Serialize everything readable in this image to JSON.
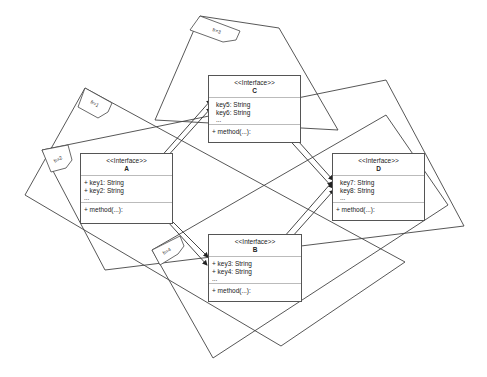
{
  "frames": [
    {
      "id": "fr1",
      "label": "fr=1"
    },
    {
      "id": "fr2",
      "label": "fr=2"
    },
    {
      "id": "fr3",
      "label": "fr=3"
    },
    {
      "id": "fr4",
      "label": "fr=4"
    }
  ],
  "classes": {
    "A": {
      "stereotype": "<<Interface>>",
      "name": "A",
      "attrs": [
        "+ key1: String",
        "+ key2: String"
      ],
      "ellipsis": "...",
      "method": "+ method(...):"
    },
    "B": {
      "stereotype": "<<Interface>>",
      "name": "B",
      "attrs": [
        "+ key3: String",
        "+ key4: String"
      ],
      "ellipsis": "...",
      "method": "+ method(...):"
    },
    "C": {
      "stereotype": "<<Interface>>",
      "name": "C",
      "attrs": [
        "key5: String",
        "key6: String"
      ],
      "ellipsis": "...",
      "method": "+ method(...):"
    },
    "D": {
      "stereotype": "<<Interface>>",
      "name": "D",
      "attrs": [
        "key7: String",
        "key8: String"
      ],
      "ellipsis": "...",
      "method": "+ method(...):"
    }
  },
  "connections": [
    {
      "from": "A",
      "to": "C.key5"
    },
    {
      "from": "A",
      "to": "C.key6"
    },
    {
      "from": "A",
      "to": "B.key3"
    },
    {
      "from": "A",
      "to": "B.key4"
    },
    {
      "from": "C",
      "to": "D.key7"
    },
    {
      "from": "C",
      "to": "D.key8"
    },
    {
      "from": "B",
      "to": "D.key7"
    },
    {
      "from": "B",
      "to": "D.key8"
    }
  ]
}
